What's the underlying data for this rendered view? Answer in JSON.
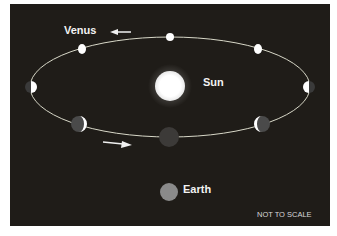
{
  "diagram": {
    "title_labels": {
      "venus": "Venus",
      "sun": "Sun",
      "earth": "Earth",
      "scale_note": "NOT TO SCALE"
    },
    "colors": {
      "background": "#1f1c18",
      "orbit": "#d8d8c8",
      "sun": "#ffffff",
      "earth": "#8a8a8a",
      "venus_lit": "#ffffff",
      "venus_dark": "#3a3a3a"
    },
    "orbit_direction": "counter-clockwise (arrow left at top, arrow right at bottom)",
    "venus_positions": [
      {
        "position": "top-left",
        "phase": "gibbous (mostly lit)"
      },
      {
        "position": "top-center",
        "phase": "full"
      },
      {
        "position": "top-right",
        "phase": "gibbous (mostly lit)"
      },
      {
        "position": "far-right",
        "phase": "half (left lit)"
      },
      {
        "position": "bottom-right",
        "phase": "crescent"
      },
      {
        "position": "bottom-center",
        "phase": "new (dark)"
      },
      {
        "position": "bottom-left",
        "phase": "crescent"
      },
      {
        "position": "far-left",
        "phase": "half (right lit)"
      }
    ]
  }
}
